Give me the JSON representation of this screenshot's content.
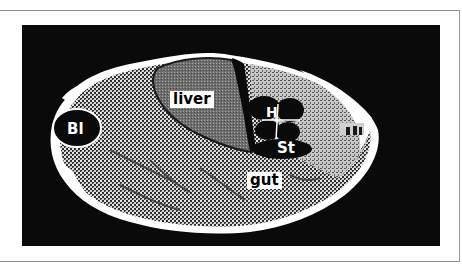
{
  "figure": {
    "title": "",
    "background_color": "#0a0a0a",
    "labels": {
      "liver": "liver",
      "bladder": "Bl",
      "heart": "H",
      "stomach": "St",
      "gut": "gut"
    }
  },
  "colors": {
    "frame_border": "#8a8a8a",
    "scan_background": "#0a0a0a",
    "liver_fill": "#7a7a7a",
    "tissue_pattern_dark": "#3a3a3a",
    "tissue_pattern_light": "#d8d8d8",
    "organ_dark": "#0a0a0a",
    "skin_white": "#ffffff"
  }
}
